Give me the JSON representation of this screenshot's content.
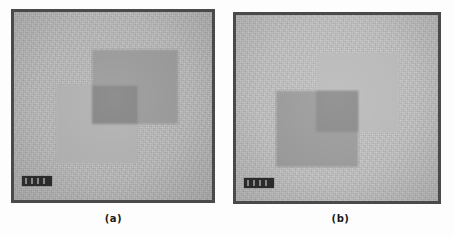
{
  "figure": {
    "background_color": "#fdfdfd",
    "panel_count": 2
  },
  "panels": [
    {
      "id": "a",
      "caption": "(a)",
      "frame": {
        "border_color": "#4a4a4a",
        "background_color": "#b9b9b9"
      },
      "scalebar": {
        "label": "",
        "segments": 4,
        "color": "#2b2b2b"
      },
      "regions": [
        {
          "name": "upper-right-square",
          "tone": "dark",
          "color": "#9a9a9a"
        },
        {
          "name": "lower-left-square",
          "tone": "light",
          "color": "#b2b2b2"
        },
        {
          "name": "overlap-square",
          "tone": "darkest",
          "color": "#828282"
        }
      ]
    },
    {
      "id": "b",
      "caption": "(b)",
      "frame": {
        "border_color": "#4a4a4a",
        "background_color": "#c2c2c2"
      },
      "scalebar": {
        "label": "",
        "segments": 4,
        "color": "#2b2b2b"
      },
      "regions": [
        {
          "name": "upper-right-square",
          "tone": "light",
          "color": "#bdbdbd"
        },
        {
          "name": "lower-left-square",
          "tone": "dark",
          "color": "#9c9c9c"
        },
        {
          "name": "overlap-square",
          "tone": "darkest",
          "color": "#8a8a8a"
        }
      ]
    }
  ]
}
